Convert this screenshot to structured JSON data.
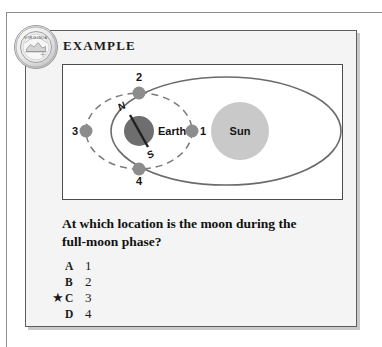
{
  "seal": {
    "name": "virginia-seal",
    "arc_text": "VIRGINIA"
  },
  "header": {
    "title": "EXAMPLE"
  },
  "diagram": {
    "earth_label": "Earth",
    "sun_label": "Sun",
    "north_pole_label": "N",
    "south_pole_label": "S",
    "moon_positions": [
      {
        "label": "1",
        "where": "right"
      },
      {
        "label": "2",
        "where": "top"
      },
      {
        "label": "3",
        "where": "left"
      },
      {
        "label": "4",
        "where": "bottom"
      }
    ],
    "colors": {
      "sun_fill": "#c9c9c9",
      "earth_fill": "#6e6e6e",
      "moon_fill": "#8c8c8c",
      "orbit_stroke": "#6b6b6b",
      "moon_orbit_stroke": "#7a7a7a"
    }
  },
  "question": {
    "text": "At which location is the moon during the full-moon phase?"
  },
  "choices": [
    {
      "star": "",
      "letter": "A",
      "text": "1"
    },
    {
      "star": "",
      "letter": "B",
      "text": "2"
    },
    {
      "star": "★",
      "letter": "C",
      "text": "3"
    },
    {
      "star": "",
      "letter": "D",
      "text": "4"
    }
  ]
}
